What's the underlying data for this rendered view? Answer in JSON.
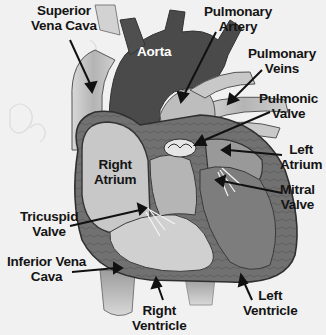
{
  "diagram": {
    "labels": {
      "superior_vena_cava": [
        "Superior",
        "Vena Cava"
      ],
      "pulmonary_artery": [
        "Pulmonary",
        "Artery"
      ],
      "aorta": [
        "Aorta"
      ],
      "pulmonary_veins": [
        "Pulmonary",
        "Veins"
      ],
      "pulmonic_valve": [
        "Pulmonic",
        "Valve"
      ],
      "right_atrium": [
        "Right",
        "Atrium"
      ],
      "left_atrium": [
        "Left",
        "Atrium"
      ],
      "mitral_valve": [
        "Mitral",
        "Valve"
      ],
      "tricuspid_valve": [
        "Tricuspid",
        "Valve"
      ],
      "inferior_vena_cava": [
        "Inferior Vena",
        "Cava"
      ],
      "right_ventricle": [
        "Right",
        "Ventricle"
      ],
      "left_ventricle": [
        "Left",
        "Ventricle"
      ]
    },
    "colors": {
      "background": "#f1f1f1",
      "aorta": "#4a4a4a",
      "vessel_light": "#b8b8b8",
      "chamber_light": "#c4c4c4",
      "muscle_dark": "#6e6e6e",
      "text": "#141414"
    }
  }
}
